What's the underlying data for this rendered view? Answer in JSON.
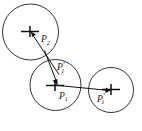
{
  "figure": {
    "background_color": "#ffffff",
    "stroke_color": "#1c1c1c",
    "marker_color": "#101010",
    "width": 142,
    "height": 131,
    "circles": [
      {
        "id": "circle-top-left",
        "cx": 30.5,
        "cy": 32.0,
        "r": 28.0
      },
      {
        "id": "circle-middle",
        "cx": 55.5,
        "cy": 85.0,
        "r": 25.5
      },
      {
        "id": "circle-right",
        "cx": 111.0,
        "cy": 90.0,
        "r": 22.5
      }
    ],
    "center_markers": [
      {
        "id": "cross-top-left",
        "cx": 30.0,
        "cy": 31.5,
        "hw": 9.0,
        "vh": 5.5
      },
      {
        "id": "cross-middle",
        "cx": 55.0,
        "cy": 85.5,
        "hw": 9.0,
        "vh": 5.5
      },
      {
        "id": "cross-right",
        "cx": 111.0,
        "cy": 89.5,
        "hw": 9.0,
        "vh": 5.5
      }
    ],
    "vectors": [
      {
        "id": "vector-to-p2",
        "x1": 58.0,
        "x2": 32.5,
        "y1": 73.0,
        "y2": 34.5
      },
      {
        "id": "vector-to-p1p",
        "x1": 48.0,
        "x2": 57.0,
        "y1": 57.0,
        "y2": 83.0
      },
      {
        "id": "vector-to-p1r",
        "x1": 55.5,
        "x2": 110.0,
        "y1": 85.0,
        "y2": 90.5
      }
    ],
    "labels": {
      "p2": {
        "base": "P",
        "sub": "2",
        "prime": "",
        "x": 41.0,
        "y": 42.0
      },
      "p1_prime": {
        "base": "P",
        "sub": "1",
        "prime": "'",
        "x": 57.0,
        "y": 70.0
      },
      "p1": {
        "base": "P",
        "sub": "1",
        "prime": "",
        "x": 59.0,
        "y": 98.5
      },
      "p1_prime_right": {
        "base": "P",
        "sub": "1",
        "prime": "'",
        "x": 97.0,
        "y": 101.5
      }
    }
  }
}
